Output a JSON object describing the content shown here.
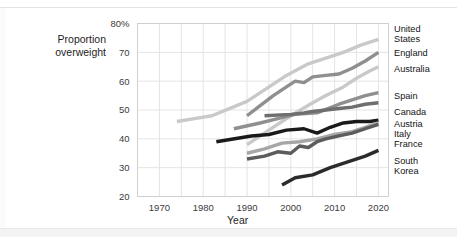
{
  "axes": {
    "ylabel_line1": "Proportion",
    "ylabel_line2": "overweight",
    "xlabel": "Year",
    "yticks": [
      "80%",
      "70",
      "60",
      "50",
      "40",
      "30",
      "20"
    ],
    "xticks": [
      "1970",
      "1980",
      "1990",
      "2000",
      "2010",
      "2020"
    ]
  },
  "legend": [
    {
      "label_line1": "United",
      "label_line2": "States"
    },
    {
      "label_line1": "England",
      "label_line2": ""
    },
    {
      "label_line1": "Australia",
      "label_line2": ""
    },
    {
      "label_line1": "Spain",
      "label_line2": ""
    },
    {
      "label_line1": "Canada",
      "label_line2": ""
    },
    {
      "label_line1": "Austria",
      "label_line2": ""
    },
    {
      "label_line1": "Italy",
      "label_line2": ""
    },
    {
      "label_line1": "France",
      "label_line2": ""
    },
    {
      "label_line1": "South",
      "label_line2": "Korea"
    }
  ],
  "chart_data": {
    "type": "line",
    "title": "",
    "xlabel": "Year",
    "ylabel": "Proportion overweight",
    "xlim": [
      1965,
      2022
    ],
    "ylim": [
      20,
      80
    ],
    "yunit": "%",
    "grid": true,
    "gridlines_x_step": 5,
    "gridlines_y_step": 10,
    "legend_position": "right",
    "series": [
      {
        "name": "United States",
        "color": "#c9c9c9",
        "x": [
          1974,
          1978,
          1982,
          1990,
          1994,
          1999,
          2004,
          2008,
          2012,
          2016,
          2020
        ],
        "values": [
          46.0,
          47.0,
          48.0,
          53.0,
          57.0,
          62.0,
          66.0,
          68.0,
          70.0,
          72.5,
          74.5
        ]
      },
      {
        "name": "England",
        "color": "#8f8f8f",
        "x": [
          1990,
          1993,
          1996,
          1999,
          2001,
          2003,
          2005,
          2008,
          2011,
          2014,
          2017,
          2020
        ],
        "values": [
          48.0,
          51.5,
          55.0,
          58.0,
          60.0,
          59.5,
          61.5,
          62.0,
          62.5,
          64.5,
          67.0,
          70.0
        ]
      },
      {
        "name": "Australia",
        "color": "#c9c9c9",
        "x": [
          1990,
          1995,
          2000,
          2005,
          2008,
          2012,
          2015,
          2018,
          2020
        ],
        "values": [
          38.0,
          43.0,
          48.0,
          52.5,
          55.0,
          58.0,
          61.0,
          63.5,
          65.0
        ]
      },
      {
        "name": "Spain",
        "color": "#8f8f8f",
        "x": [
          1987,
          1993,
          1997,
          2001,
          2006,
          2011,
          2014,
          2017,
          2020
        ],
        "values": [
          43.5,
          45.5,
          47.0,
          48.5,
          49.0,
          52.0,
          53.5,
          55.0,
          56.0
        ]
      },
      {
        "name": "Canada",
        "color": "#6e6e6e",
        "x": [
          1994,
          2000,
          2003,
          2005,
          2008,
          2011,
          2014,
          2017,
          2020
        ],
        "values": [
          48.0,
          48.5,
          49.0,
          49.5,
          50.0,
          50.5,
          51.0,
          52.0,
          52.5
        ]
      },
      {
        "name": "Austria",
        "color": "#1a1a1a",
        "x": [
          1983,
          1991,
          1995,
          1999,
          2003,
          2006,
          2009,
          2012,
          2015,
          2018,
          2020
        ],
        "values": [
          39.0,
          41.0,
          41.5,
          43.0,
          43.5,
          42.0,
          44.0,
          45.5,
          46.0,
          46.0,
          46.5
        ]
      },
      {
        "name": "Italy",
        "color": "#a6a6a6",
        "x": [
          1990,
          1994,
          1998,
          2002,
          2006,
          2010,
          2014,
          2017,
          2020
        ],
        "values": [
          35.0,
          36.5,
          38.5,
          39.0,
          40.0,
          41.5,
          42.5,
          44.0,
          45.5
        ]
      },
      {
        "name": "France",
        "color": "#5c5c5c",
        "x": [
          1990,
          1994,
          1997,
          2000,
          2002,
          2004,
          2006,
          2008,
          2011,
          2014,
          2017,
          2020
        ],
        "values": [
          33.0,
          34.0,
          35.5,
          35.0,
          37.5,
          37.0,
          39.0,
          40.0,
          41.0,
          42.0,
          43.5,
          45.0
        ]
      },
      {
        "name": "South Korea",
        "color": "#2b2b2b",
        "x": [
          1998,
          2001,
          2005,
          2009,
          2013,
          2017,
          2020
        ],
        "values": [
          24.0,
          26.5,
          27.5,
          30.0,
          32.0,
          34.0,
          36.0
        ]
      }
    ]
  }
}
